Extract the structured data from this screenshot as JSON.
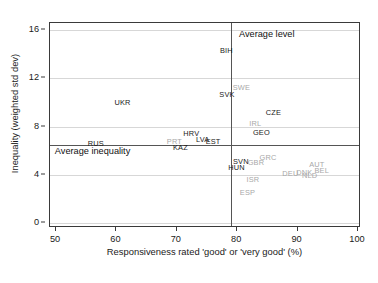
{
  "chart_data": {
    "type": "scatter",
    "title": "",
    "xlabel": "Responsiveness rated 'good' or 'very good' (%)",
    "ylabel": "Inequality (weighted std dev)",
    "xlim": [
      49,
      100.5
    ],
    "ylim": [
      -0.4,
      16.6
    ],
    "xticks": [
      50,
      60,
      70,
      80,
      90,
      100
    ],
    "yticks": [
      0,
      4,
      8,
      12,
      16
    ],
    "grid": "horizontal",
    "legend": "none",
    "reference_lines": {
      "vertical_x": 79.0,
      "horizontal_y": 6.5
    },
    "annotations": [
      {
        "text": "Average level",
        "x": 80.3,
        "y": 15.6
      },
      {
        "text": "Average inequality",
        "x": 49.8,
        "y": 5.9
      }
    ],
    "points": [
      {
        "label": "BIH",
        "x": 78.2,
        "y": 14.3,
        "color": "dark"
      },
      {
        "label": "SWE",
        "x": 80.7,
        "y": 11.2,
        "color": "grey"
      },
      {
        "label": "SVK",
        "x": 78.3,
        "y": 10.6,
        "color": "dark"
      },
      {
        "label": "UKR",
        "x": 61.0,
        "y": 10.0,
        "color": "dark"
      },
      {
        "label": "CZE",
        "x": 86.0,
        "y": 9.1,
        "color": "dark"
      },
      {
        "label": "IRL",
        "x": 83.0,
        "y": 8.2,
        "color": "grey"
      },
      {
        "label": "GEO",
        "x": 84.0,
        "y": 7.5,
        "color": "dark"
      },
      {
        "label": "HRV",
        "x": 72.4,
        "y": 7.4,
        "color": "dark"
      },
      {
        "label": "LVA",
        "x": 74.3,
        "y": 6.9,
        "color": "dark"
      },
      {
        "label": "EST",
        "x": 76.0,
        "y": 6.7,
        "color": "dark"
      },
      {
        "label": "PRT",
        "x": 69.6,
        "y": 6.7,
        "color": "grey"
      },
      {
        "label": "RUS",
        "x": 56.6,
        "y": 6.6,
        "color": "dark"
      },
      {
        "label": "KAZ",
        "x": 70.6,
        "y": 6.2,
        "color": "dark"
      },
      {
        "label": "GRC",
        "x": 85.1,
        "y": 5.4,
        "color": "grey"
      },
      {
        "label": "SVN",
        "x": 80.6,
        "y": 5.1,
        "color": "dark"
      },
      {
        "label": "GBR",
        "x": 83.1,
        "y": 5.0,
        "color": "grey"
      },
      {
        "label": "AUT",
        "x": 93.2,
        "y": 4.8,
        "color": "grey"
      },
      {
        "label": "HUN",
        "x": 79.9,
        "y": 4.6,
        "color": "dark"
      },
      {
        "label": "BEL",
        "x": 94.0,
        "y": 4.3,
        "color": "grey"
      },
      {
        "label": "DNK",
        "x": 91.1,
        "y": 4.2,
        "color": "grey"
      },
      {
        "label": "DEU",
        "x": 88.8,
        "y": 4.1,
        "color": "grey"
      },
      {
        "label": "NLD",
        "x": 92.0,
        "y": 3.9,
        "color": "grey"
      },
      {
        "label": "ISR",
        "x": 82.6,
        "y": 3.6,
        "color": "grey"
      },
      {
        "label": "ESP",
        "x": 81.7,
        "y": 2.5,
        "color": "grey"
      }
    ]
  }
}
